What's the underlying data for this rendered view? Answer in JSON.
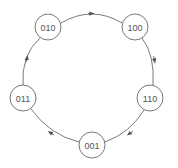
{
  "diagram": {
    "type": "state-cycle",
    "colors": {
      "stroke": "#6a6a6a",
      "text": "#555555",
      "background": "#ffffff"
    },
    "nodes": [
      {
        "id": "n010",
        "label": "010",
        "cx": 48,
        "cy": 27
      },
      {
        "id": "n100",
        "label": "100",
        "cx": 135,
        "cy": 27
      },
      {
        "id": "n110",
        "label": "110",
        "cx": 150,
        "cy": 98
      },
      {
        "id": "n001",
        "label": "001",
        "cx": 92,
        "cy": 145
      },
      {
        "id": "n011",
        "label": "011",
        "cx": 23,
        "cy": 98
      }
    ],
    "edges": [
      {
        "from": "010",
        "to": "100"
      },
      {
        "from": "100",
        "to": "110"
      },
      {
        "from": "110",
        "to": "001"
      },
      {
        "from": "001",
        "to": "011"
      },
      {
        "from": "011",
        "to": "010"
      }
    ]
  }
}
